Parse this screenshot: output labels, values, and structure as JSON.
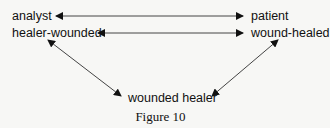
{
  "nodes": {
    "analyst": "analyst",
    "patient": "patient",
    "healer_wounded": "healer-wounded",
    "wound_healed": "wound-healed",
    "wounded_healer": "wounded healer"
  },
  "caption": "Figure 10",
  "colors": {
    "line": "#444444",
    "arrowhead": "#111111",
    "background": "#f7f7f5"
  }
}
